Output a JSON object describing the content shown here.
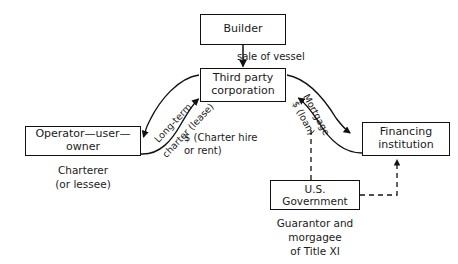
{
  "diagram": {
    "stroke_color": "#111111",
    "background": "#ffffff",
    "nodes": [
      {
        "id": "builder",
        "label": "Builder"
      },
      {
        "id": "third_party",
        "label": "Third party\ncorporation"
      },
      {
        "id": "operator",
        "label": "Operator—user—owner"
      },
      {
        "id": "financing",
        "label": "Financing\ninstitution"
      },
      {
        "id": "government",
        "label": "U.S. Government"
      }
    ],
    "captions": [
      {
        "id": "charterer",
        "text": "Charterer\n(or lessee)"
      },
      {
        "id": "government",
        "text": "Guarantor and\nmorgagee\nof Title XI"
      }
    ],
    "edge_labels": [
      {
        "id": "sale_of_vessel",
        "text": "sale of vessel"
      },
      {
        "id": "charter_hire",
        "text": "$ (Charter hire\n    or rent)"
      },
      {
        "id": "long_term",
        "text": "Long-term"
      },
      {
        "id": "charter_lease",
        "text": "charter (lease)"
      },
      {
        "id": "mortgage",
        "text": "Mortgage"
      },
      {
        "id": "loan",
        "text": "$ (loan)"
      }
    ],
    "edges": [
      {
        "id": "builder-to-third-party",
        "from": "builder",
        "to": "third_party",
        "style": "solid",
        "label": "sale of vessel"
      },
      {
        "id": "third-party-to-operator",
        "from": "third_party",
        "to": "operator",
        "style": "curved-solid",
        "label": "Long-term charter (lease)"
      },
      {
        "id": "operator-to-third-party",
        "from": "operator",
        "to": "third_party",
        "style": "curved-solid",
        "label": "$ (Charter hire or rent)"
      },
      {
        "id": "third-party-to-financing",
        "from": "third_party",
        "to": "financing",
        "style": "curved-solid",
        "label": "Mortgage"
      },
      {
        "id": "financing-to-third-party",
        "from": "financing",
        "to": "third_party",
        "style": "curved-solid",
        "label": "$ (loan)"
      },
      {
        "id": "government-to-loan-curve",
        "from": "government",
        "to": "loan_curve",
        "style": "dashed",
        "label": ""
      },
      {
        "id": "government-to-financing",
        "from": "government",
        "to": "financing",
        "style": "dashed",
        "label": ""
      }
    ]
  }
}
